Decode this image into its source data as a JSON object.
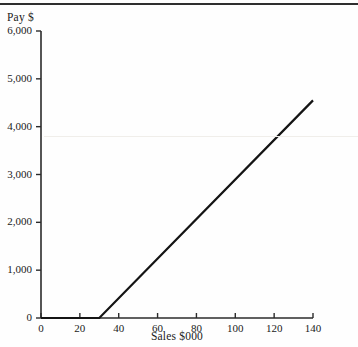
{
  "chart_data": {
    "type": "line",
    "title": "",
    "xlabel": "Sales $000",
    "ylabel": "Pay $",
    "xlim": [
      0,
      140
    ],
    "ylim": [
      0,
      6000
    ],
    "grid": false,
    "legend": null,
    "x_ticks": [
      "0",
      "20",
      "40",
      "60",
      "80",
      "100",
      "120",
      "140"
    ],
    "x_tick_values": [
      0,
      20,
      40,
      60,
      80,
      100,
      120,
      140
    ],
    "y_ticks": [
      "0",
      "1,000",
      "2,000",
      "3,000",
      "4,000",
      "5,000",
      "6,000"
    ],
    "y_tick_values": [
      0,
      1000,
      2000,
      3000,
      4000,
      5000,
      6000
    ],
    "series": [
      {
        "name": "Pay",
        "color": "#141414",
        "points": [
          {
            "x": 0,
            "y": 0
          },
          {
            "x": 30,
            "y": 0
          },
          {
            "x": 140,
            "y": 4550
          }
        ]
      }
    ],
    "annotations": []
  },
  "axes": {
    "y_title": "Pay $",
    "x_title": "Sales $000"
  },
  "colors": {
    "line": "#141414",
    "axis": "#2b2b2b",
    "background": "#fefefe",
    "top_rule": "#2e2e2e"
  }
}
